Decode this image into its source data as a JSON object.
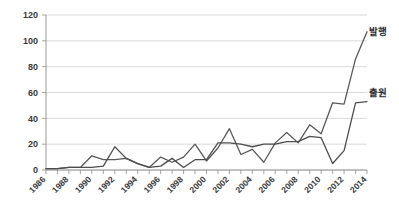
{
  "chart_data": {
    "type": "line",
    "title": "",
    "xlabel": "",
    "ylabel": "",
    "xlim": [
      1986,
      2014
    ],
    "ylim": [
      0,
      120
    ],
    "ytick_values": [
      0,
      20,
      40,
      60,
      80,
      100,
      120
    ],
    "xtick_labels": [
      "1986",
      "1988",
      "1990",
      "1992",
      "1994",
      "1996",
      "1998",
      "2000",
      "2002",
      "2004",
      "2006",
      "2008",
      "2010",
      "2012",
      "2014"
    ],
    "x": [
      1986,
      1987,
      1988,
      1989,
      1990,
      1991,
      1992,
      1993,
      1994,
      1995,
      1996,
      1997,
      1998,
      1999,
      2000,
      2001,
      2002,
      2003,
      2004,
      2005,
      2006,
      2007,
      2008,
      2009,
      2010,
      2011,
      2012,
      2013,
      2014
    ],
    "grid": true,
    "legend_position": "right-inline",
    "series": [
      {
        "name": "발행",
        "color": "#595959",
        "values": [
          1,
          1,
          2,
          2,
          11,
          8,
          8,
          9,
          5,
          2,
          10,
          6,
          10,
          20,
          7,
          17,
          32,
          12,
          16,
          6,
          21,
          29,
          21,
          35,
          28,
          52,
          51,
          86,
          107
        ]
      },
      {
        "name": "출원",
        "color": "#4d4d4d",
        "values": [
          1,
          1,
          2,
          2,
          2,
          3,
          18,
          9,
          5,
          2,
          3,
          9,
          2,
          8,
          8,
          21,
          21,
          20,
          18,
          20,
          20,
          22,
          22,
          26,
          25,
          5,
          15,
          52,
          53
        ]
      }
    ],
    "annotations": [
      {
        "text": "발행",
        "x_px": 369,
        "y_px": 35
      },
      {
        "text": "출원",
        "x_px": 369,
        "y_px": 96
      }
    ]
  },
  "axis": {
    "y_labels": [
      "120",
      "100",
      "80",
      "60",
      "40",
      "20",
      "0"
    ],
    "x_labels": [
      "1986",
      "1988",
      "1990",
      "1992",
      "1994",
      "1996",
      "1998",
      "2000",
      "2002",
      "2004",
      "2006",
      "2008",
      "2010",
      "2012",
      "2014"
    ]
  },
  "legend": {
    "issuance_label": "발행",
    "application_label": "출원"
  },
  "colors": {
    "background": "#ffffff",
    "gridline": "#c9c9c9",
    "axis": "#8e8e8e",
    "series_issuance": "#595959",
    "series_application": "#4d4d4d",
    "text": "#2b2b2b"
  }
}
